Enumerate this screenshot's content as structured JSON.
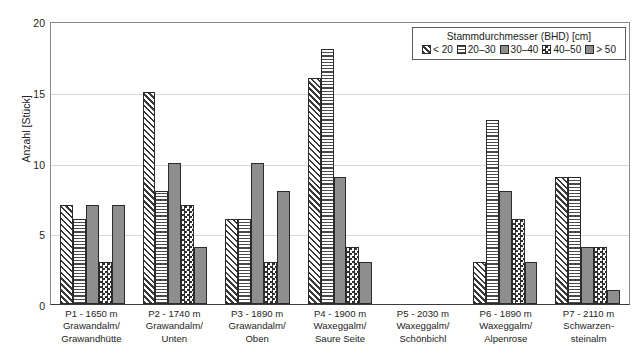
{
  "chart_data": {
    "type": "bar",
    "title": "",
    "xlabel": "",
    "ylabel": "Anzahl [Stück]",
    "ylim": [
      0,
      20
    ],
    "yticks": [
      0,
      5,
      10,
      15,
      20
    ],
    "grid": true,
    "legend_position": "top-right",
    "legend_title": "Stammdurchmesser (BHD) [cm]",
    "categories": [
      "P1 - 1650 m Grawandalm/ Grawandhütte",
      "P2 - 1740 m Grawandalm/ Unten",
      "P3 - 1890 m Grawandalm/ Oben",
      "P4 - 1900 m Waxeggalm/ Saure Seite",
      "P5 - 2030 m Waxeggalm/ Schönbichl",
      "P6 - 1890 m Waxeggalm/ Alpenrose",
      "P7 - 2110 m Schwarzen- steinalm"
    ],
    "series": [
      {
        "name": "< 20",
        "pattern": "diagonal-hatch",
        "values": [
          7,
          15,
          6,
          16,
          0,
          3,
          9
        ]
      },
      {
        "name": "20–30",
        "pattern": "horizontal-lines",
        "values": [
          6,
          8,
          6,
          18,
          0,
          13,
          9
        ]
      },
      {
        "name": "30–40",
        "pattern": "solid-gray",
        "values": [
          7,
          10,
          10,
          9,
          0,
          8,
          4
        ]
      },
      {
        "name": "40–50",
        "pattern": "checkerboard",
        "values": [
          3,
          7,
          3,
          4,
          0,
          6,
          4
        ]
      },
      {
        "name": "> 50",
        "pattern": "solid-gray",
        "values": [
          7,
          4,
          8,
          3,
          0,
          3,
          1
        ]
      }
    ]
  },
  "axis": {
    "ylabel": "Anzahl [Stück]",
    "yticks": [
      "0",
      "5",
      "10",
      "15",
      "20"
    ]
  },
  "legend": {
    "title": "Stammdurchmesser (BHD) [cm]",
    "items": [
      {
        "label": "< 20"
      },
      {
        "label": "20–30"
      },
      {
        "label": "30–40"
      },
      {
        "label": "40–50"
      },
      {
        "label": "> 50"
      }
    ]
  },
  "xaxis": {
    "groups": [
      {
        "line1": "P1 - 1650 m",
        "line2": "Grawandalm/",
        "line3": "Grawandhütte"
      },
      {
        "line1": "P2 - 1740 m",
        "line2": "Grawandalm/",
        "line3": "Unten"
      },
      {
        "line1": "P3 - 1890 m",
        "line2": "Grawandalm/",
        "line3": "Oben"
      },
      {
        "line1": "P4 - 1900 m",
        "line2": "Waxeggalm/",
        "line3": "Saure Seite"
      },
      {
        "line1": "P5 - 2030 m",
        "line2": "Waxeggalm/",
        "line3": "Schönbichl"
      },
      {
        "line1": "P6 - 1890 m",
        "line2": "Waxeggalm/",
        "line3": "Alpenrose"
      },
      {
        "line1": "P7 - 2110 m",
        "line2": "Schwarzen-",
        "line3": "steinalm"
      }
    ]
  }
}
